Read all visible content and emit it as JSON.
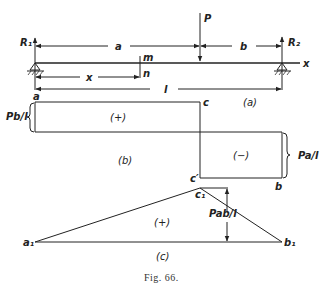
{
  "figure": {
    "caption": "Fig. 66.",
    "panel_a": {
      "label": "(a)",
      "reaction_left": "R₁",
      "reaction_right": "R₂",
      "load": "P",
      "dim_a": "a",
      "dim_b": "b",
      "dim_x": "x",
      "dim_l": "l",
      "section_top": "m",
      "section_bottom": "n",
      "axis": "x"
    },
    "panel_b": {
      "label": "(b)",
      "corner_a": "a",
      "corner_c": "c",
      "corner_c_prime": "c′",
      "corner_b": "b",
      "positive_sign": "(+)",
      "negative_sign": "(−)",
      "left_magnitude": "Pb/l",
      "right_magnitude": "Pa/l"
    },
    "panel_c": {
      "label": "(c)",
      "vertex_a1": "a₁",
      "vertex_c1": "c₁",
      "vertex_b1": "b₁",
      "sign": "(+)",
      "peak_magnitude": "Pab/l"
    }
  },
  "colors": {
    "ink": "#222222",
    "paper": "#ffffff"
  }
}
